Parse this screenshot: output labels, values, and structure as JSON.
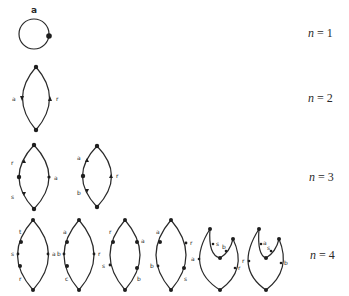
{
  "rows": [
    {
      "n_label": "n",
      "eq": " = ",
      "value": "1",
      "diagrams": [
        {
          "labels": [
            "a"
          ]
        }
      ]
    },
    {
      "n_label": "n",
      "eq": " = ",
      "value": "2",
      "diagrams": [
        {
          "labels": [
            "a",
            "r"
          ]
        }
      ]
    },
    {
      "n_label": "n",
      "eq": " = ",
      "value": "3",
      "diagrams": [
        {
          "labels": [
            "r",
            "s",
            "a"
          ]
        },
        {
          "labels": [
            "a",
            "b",
            "r"
          ]
        }
      ]
    },
    {
      "n_label": "n",
      "eq": " = ",
      "value": "4",
      "diagrams": [
        {
          "labels": [
            "t",
            "s",
            "r",
            "a"
          ]
        },
        {
          "labels": [
            "a",
            "b",
            "c",
            "r"
          ]
        },
        {
          "labels": [
            "r",
            "s",
            "a",
            "b"
          ]
        },
        {
          "labels": [
            "a",
            "b",
            "r",
            "s"
          ]
        },
        {
          "labels": [
            "a",
            "s",
            "b",
            "r"
          ]
        },
        {
          "labels": [
            "r",
            "a",
            "s",
            "b"
          ]
        }
      ]
    }
  ],
  "colors": {
    "ink": "#2a2a2a",
    "background": "#ffffff"
  }
}
